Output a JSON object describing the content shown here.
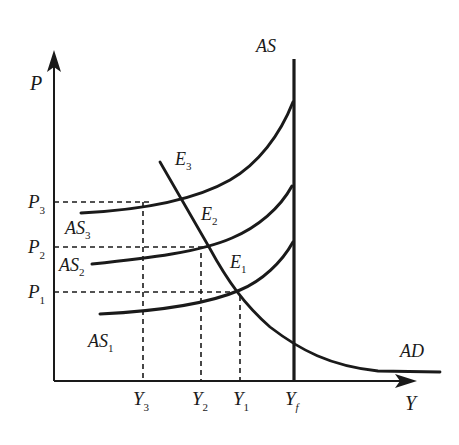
{
  "diagram": {
    "type": "economics-as-ad",
    "axes": {
      "y_label": "P",
      "x_label": "Y"
    },
    "curves": {
      "as_vertical": {
        "label": "AS",
        "x_position": "Yf"
      },
      "ad": {
        "label": "AD"
      },
      "as_curves": [
        {
          "label": "AS",
          "sub": "1"
        },
        {
          "label": "AS",
          "sub": "2"
        },
        {
          "label": "AS",
          "sub": "3"
        }
      ]
    },
    "equilibria": [
      {
        "label": "E",
        "sub": "1"
      },
      {
        "label": "E",
        "sub": "2"
      },
      {
        "label": "E",
        "sub": "3"
      }
    ],
    "price_levels": [
      {
        "label": "P",
        "sub": "1"
      },
      {
        "label": "P",
        "sub": "2"
      },
      {
        "label": "P",
        "sub": "3"
      }
    ],
    "output_levels": [
      {
        "label": "Y",
        "sub": "3"
      },
      {
        "label": "Y",
        "sub": "2"
      },
      {
        "label": "Y",
        "sub": "1"
      },
      {
        "label": "Y",
        "sub": "f"
      }
    ],
    "colors": {
      "ink": "#1a1a1a",
      "background": "#ffffff"
    }
  }
}
